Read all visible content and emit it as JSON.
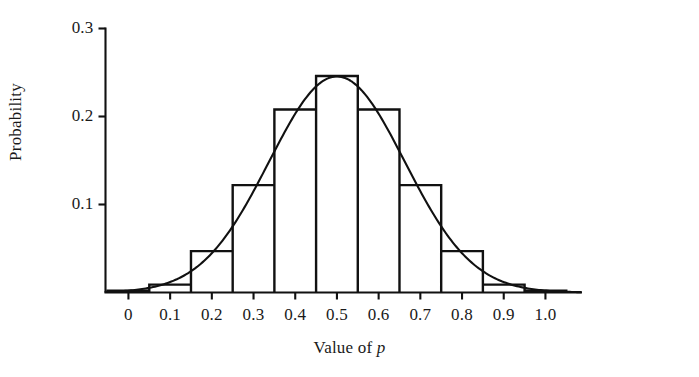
{
  "chart_data": {
    "type": "bar",
    "title": "",
    "subtitle": "",
    "xlabel": "Value of p",
    "xlabel_plain": "Value of ",
    "xlabel_italic": "p",
    "ylabel": "Probability",
    "grid": false,
    "legend": "none",
    "xlim": [
      -0.06,
      1.09
    ],
    "ylim": [
      0.0,
      0.3
    ],
    "x_tick_labels": [
      "0",
      "0.1",
      "0.2",
      "0.3",
      "0.4",
      "0.5",
      "0.6",
      "0.7",
      "0.8",
      "0.9",
      "1.0"
    ],
    "x_tick_values": [
      0.0,
      0.1,
      0.2,
      0.3,
      0.4,
      0.5,
      0.6,
      0.7,
      0.8,
      0.9,
      1.0
    ],
    "y_tick_labels": [
      "0.1",
      "0.2",
      "0.3"
    ],
    "y_tick_values": [
      0.1,
      0.2,
      0.3
    ],
    "bin_width": 0.1,
    "categories": [
      "0.0",
      "0.1",
      "0.2",
      "0.3",
      "0.4",
      "0.5",
      "0.6",
      "0.7",
      "0.8",
      "0.9",
      "1.0"
    ],
    "values": [
      0.002,
      0.009,
      0.047,
      0.122,
      0.208,
      0.246,
      0.208,
      0.122,
      0.047,
      0.009,
      0.002
    ],
    "series": [
      {
        "name": "Binomial probability histogram",
        "type": "bar",
        "values": [
          0.002,
          0.009,
          0.047,
          0.122,
          0.208,
          0.246,
          0.208,
          0.122,
          0.047,
          0.009,
          0.002
        ]
      },
      {
        "name": "Normal approximation curve",
        "type": "line",
        "mean": 0.5,
        "sigma": 0.1625,
        "peak": 0.2455,
        "x": [
          0.0,
          0.05,
          0.1,
          0.15,
          0.2,
          0.25,
          0.3,
          0.35,
          0.4,
          0.45,
          0.5,
          0.55,
          0.6,
          0.65,
          0.7,
          0.75,
          0.8,
          0.85,
          0.9,
          0.95,
          1.0
        ],
        "values": [
          0.0029,
          0.0073,
          0.0162,
          0.0318,
          0.0553,
          0.0851,
          0.1158,
          0.1395,
          0.1487,
          0.1404,
          0.1175,
          0.1404,
          0.1487,
          0.1395,
          0.1158,
          0.0851,
          0.0553,
          0.0318,
          0.0162,
          0.0073,
          0.0029
        ]
      }
    ],
    "colors": {
      "line": "#111111",
      "bar_edge": "#111111",
      "bar_fill": "#ffffff",
      "axis": "#111111",
      "text": "#1a1a1a"
    }
  }
}
